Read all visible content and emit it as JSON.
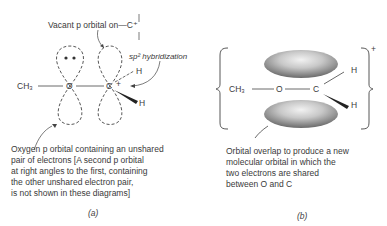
{
  "panel_a": {
    "label_vacant": "Vacant p orbital on—C⁺",
    "label_sp2": "sp² hybridization",
    "atom_ch3": "CH₃",
    "atom_o": "O",
    "atom_c": "C",
    "charge": "+",
    "atom_h1": "H",
    "atom_h2": "H",
    "desc_lines": [
      "Oxygen p orbital containing an unshared",
      "pair of  electrons   [A second p orbital",
      "at right angles to the first, containing",
      "the other unshared electron pair,",
      " is not shown in these diagrams]"
    ],
    "caption": "(a)"
  },
  "panel_b": {
    "atom_ch3": "CH₃",
    "atom_o": "O",
    "atom_c": "C",
    "atom_h1": "H",
    "atom_h2": "H",
    "charge": "+",
    "desc_lines": [
      "Orbital overlap to produce a new",
      "molecular orbital in which the",
      "two electrons are shared",
      "between O and C"
    ],
    "caption": "(b)"
  }
}
